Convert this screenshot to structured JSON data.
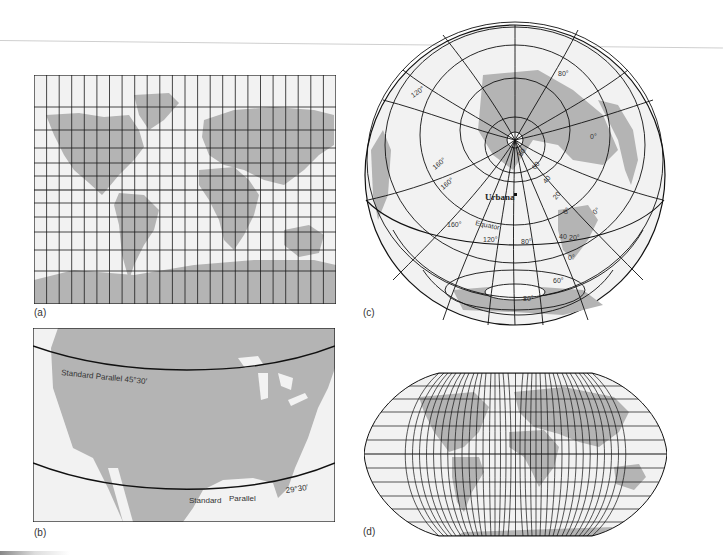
{
  "figure": {
    "panels": [
      {
        "id": "a",
        "caption": "(a)",
        "projection": "Mercator (rectangular grid)",
        "grid_columns": 24,
        "grid_rows": 12
      },
      {
        "id": "b",
        "caption": "(b)",
        "projection": "Conic (North America)",
        "labels": {
          "upper_parallel": "Standard Parallel 45°30′",
          "lower_parallel_left": "Standard",
          "lower_parallel_mid": "Parallel",
          "lower_parallel_right": "29°30′"
        }
      },
      {
        "id": "c",
        "caption": "(c)",
        "projection": "Azimuthal centered on Urbana",
        "labels": {
          "city": "Urbana",
          "equator": "Equator",
          "lon_120_top": "120°",
          "lon_160_a": "160°",
          "lon_160_b": "160°",
          "lon_160_c": "160°",
          "lon_120_bottom": "120°",
          "lon_80_bottom": "80°",
          "lat_80_top": "80°",
          "lon_0_right": "0°",
          "lat_80_pole": "80",
          "lat_60": "60",
          "lat_40": "40",
          "lat_20": "20",
          "lat_0": "0°",
          "lon_0_mid": "0°",
          "lon_40": "40",
          "lon_20": "20°",
          "lat_0_lower": "0°",
          "lat_60_south": "60°",
          "lat_80_south": "80°"
        }
      },
      {
        "id": "d",
        "caption": "(d)",
        "projection": "Robinson (pseudo-cylindrical)",
        "meridians": 36,
        "parallels": 12
      }
    ],
    "colors": {
      "land": "#b4b4b4",
      "ocean": "#f2f2f2",
      "grid": "#1a1a1a",
      "background": "#ffffff"
    }
  }
}
